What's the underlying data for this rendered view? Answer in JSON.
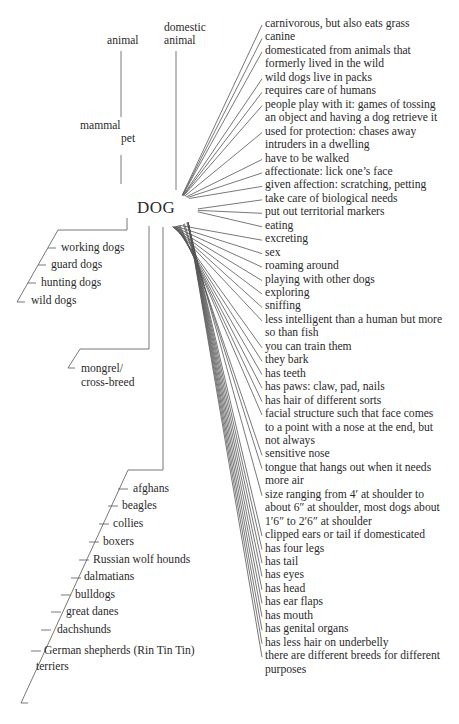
{
  "hub": {
    "label": "DOG"
  },
  "superordinates": {
    "animal": "animal",
    "domestic_animal": [
      "domestic",
      "animal"
    ],
    "mammal": "mammal",
    "pet": "pet"
  },
  "types": [
    "working dogs",
    "guard dogs",
    "hunting dogs",
    "wild dogs"
  ],
  "mongrel": [
    "mongrel/",
    "cross-breed"
  ],
  "breeds": [
    "afghans",
    "beagles",
    "collies",
    "boxers",
    "Russian wolf hounds",
    "dalmatians",
    "bulldogs",
    "great danes",
    "dachshunds",
    "German shepherds (Rin Tin Tin)",
    "terriers"
  ],
  "attributes": [
    [
      "carnivorous, but also eats grass"
    ],
    [
      "canine"
    ],
    [
      "domesticated from animals that",
      "formerly lived in the wild"
    ],
    [
      "wild dogs live in packs"
    ],
    [
      "requires care of humans"
    ],
    [
      "people play with it: games of tossing",
      "an object and having a dog retrieve it"
    ],
    [
      "used for protection: chases away",
      "intruders in a dwelling"
    ],
    [
      "have to be walked"
    ],
    [
      "affectionate: lick one’s face"
    ],
    [
      "given affection: scratching, petting"
    ],
    [
      "take care of biological needs"
    ],
    [
      "put out territorial markers"
    ],
    [
      "eating"
    ],
    [
      "excreting"
    ],
    [
      "sex"
    ],
    [
      "roaming around"
    ],
    [
      "playing with other dogs"
    ],
    [
      "exploring"
    ],
    [
      "sniffing"
    ],
    [
      "less intelligent than a human but more",
      "so than fish"
    ],
    [
      "you can train them"
    ],
    [
      "they bark"
    ],
    [
      "has teeth"
    ],
    [
      "has paws: claw, pad, nails"
    ],
    [
      "has hair of different sorts"
    ],
    [
      "facial structure such that face comes",
      "to a point with a nose at the end, but",
      "not always"
    ],
    [
      "sensitive nose"
    ],
    [
      "tongue that hangs out when it needs",
      "more air"
    ],
    [
      "size ranging from 4′ at shoulder to",
      "about 6″ at shoulder, most dogs about",
      "1′6″ to 2′6″ at shoulder"
    ],
    [
      "clipped ears or tail if domesticated"
    ],
    [
      "has four legs"
    ],
    [
      "has tail"
    ],
    [
      "has eyes"
    ],
    [
      "has head"
    ],
    [
      "has ear flaps"
    ],
    [
      "has mouth"
    ],
    [
      "has genital organs"
    ],
    [
      "has less hair on underbelly"
    ],
    [
      "there are different breeds for different",
      "purposes"
    ]
  ]
}
